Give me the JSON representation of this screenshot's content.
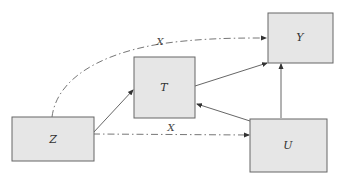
{
  "diagram": {
    "type": "causal-graph",
    "colors": {
      "box_fill": "#e6e6e6",
      "box_stroke": "#666666",
      "edge": "#555555",
      "text": "#333333",
      "background": "#ffffff"
    },
    "nodes": [
      {
        "id": "Z",
        "label": "Z",
        "x": 12,
        "y": 117,
        "w": 82,
        "h": 44
      },
      {
        "id": "T",
        "label": "T",
        "x": 134,
        "y": 57,
        "w": 61,
        "h": 61
      },
      {
        "id": "Y",
        "label": "Y",
        "x": 268,
        "y": 13,
        "w": 65,
        "h": 50
      },
      {
        "id": "U",
        "label": "U",
        "x": 250,
        "y": 119,
        "w": 77,
        "h": 53
      }
    ],
    "edges": [
      {
        "from": "Z",
        "to": "T",
        "style": "solid"
      },
      {
        "from": "T",
        "to": "Y",
        "style": "solid"
      },
      {
        "from": "U",
        "to": "T",
        "style": "solid"
      },
      {
        "from": "U",
        "to": "Y",
        "style": "solid"
      },
      {
        "from": "Z",
        "to": "U",
        "style": "dash-dot",
        "label": "X"
      },
      {
        "from": "Z",
        "to": "Y",
        "style": "dash-dot-curved",
        "label": "X"
      }
    ],
    "edge_labels": {
      "upper": "X",
      "lower": "X"
    }
  }
}
